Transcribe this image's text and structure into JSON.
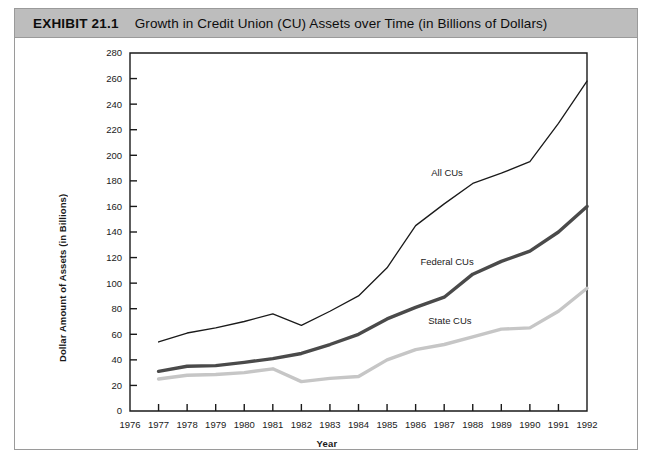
{
  "exhibit": {
    "number": "EXHIBIT 21.1",
    "title": "Growth in Credit Union (CU) Assets over Time (in Billions of Dollars)"
  },
  "chart_data": {
    "type": "line",
    "title": "Growth in Credit Union (CU) Assets over Time (in Billions of Dollars)",
    "xlabel": "Year",
    "ylabel": "Dollar Amount of Assets (in Billions)",
    "xlim": [
      1976,
      1992
    ],
    "ylim": [
      0,
      280
    ],
    "ytick_step": 20,
    "grid": false,
    "legend_position": "inline-annotations",
    "x": [
      1977,
      1978,
      1979,
      1980,
      1981,
      1982,
      1983,
      1984,
      1985,
      1986,
      1987,
      1988,
      1989,
      1990,
      1991,
      1992
    ],
    "xticks": [
      "1976",
      "1977",
      "1978",
      "1979",
      "1980",
      "1981",
      "1982",
      "1983",
      "1984",
      "1985",
      "1986",
      "1987",
      "1988",
      "1989",
      "1990",
      "1991",
      "1992"
    ],
    "yticks": [
      "0",
      "20",
      "40",
      "60",
      "80",
      "100",
      "120",
      "140",
      "160",
      "180",
      "200",
      "220",
      "240",
      "260",
      "280"
    ],
    "series": [
      {
        "name": "All CUs",
        "color": "#1a1a1a",
        "width": 1.3,
        "values": [
          54,
          61,
          65,
          70,
          76,
          67,
          78,
          90,
          112,
          145,
          162,
          178,
          186,
          195,
          225,
          258
        ]
      },
      {
        "name": "Federal CUs",
        "color": "#4a4a4a",
        "width": 3.4,
        "values": [
          31,
          35,
          35.5,
          38,
          41,
          45,
          52,
          60,
          72,
          81,
          89,
          107,
          117,
          125,
          140,
          160
        ]
      },
      {
        "name": "State CUs",
        "color": "#c6c6c6",
        "width": 3.4,
        "values": [
          25,
          28,
          28.5,
          30,
          33,
          23,
          25.5,
          27,
          40,
          48,
          52,
          58,
          64,
          65,
          78,
          96
        ]
      }
    ],
    "annotations": [
      {
        "text": "All CUs",
        "x": 1987.1,
        "y": 184
      },
      {
        "text": "Federal CUs",
        "x": 1987.1,
        "y": 114
      },
      {
        "text": "State CUs",
        "x": 1987.2,
        "y": 68
      }
    ]
  }
}
